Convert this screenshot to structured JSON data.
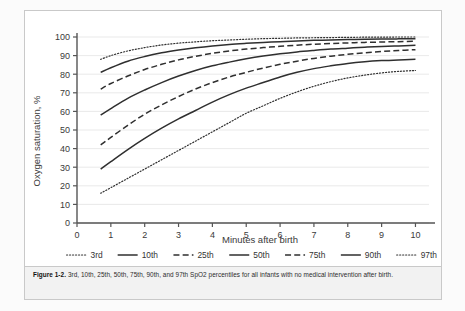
{
  "figure": {
    "caption_label": "Figure 1-2.",
    "caption_text": "3rd, 10th, 25th, 50th, 75th, 90th, and 97th SpO2 percentiles for all infants with no medical intervention after birth."
  },
  "chart_data": {
    "type": "line",
    "title": "",
    "xlabel": "Minutes after birth",
    "ylabel": "Oxygen saturation, %",
    "xlim": [
      0,
      10.4
    ],
    "ylim": [
      0,
      103
    ],
    "xticks": [
      "0",
      "1",
      "2",
      "3",
      "4",
      "5",
      "6",
      "7",
      "8",
      "9",
      "10"
    ],
    "yticks": [
      "0",
      "10",
      "20",
      "30",
      "40",
      "50",
      "60",
      "70",
      "80",
      "90",
      "100"
    ],
    "grid": true,
    "legend_position": "bottom",
    "x": [
      0.7,
      1,
      1.5,
      2,
      2.5,
      3,
      3.5,
      4,
      4.5,
      5,
      5.5,
      6,
      6.5,
      7,
      7.5,
      8,
      8.5,
      9,
      9.5,
      10
    ],
    "series": [
      {
        "name": "3rd",
        "style": "dotted",
        "values": [
          16,
          19,
          24,
          29,
          34,
          39,
          44,
          49,
          54,
          59,
          63,
          67,
          70.5,
          73.5,
          76,
          78,
          79.5,
          80.7,
          81.5,
          82
        ]
      },
      {
        "name": "10th",
        "style": "solid",
        "values": [
          29,
          33,
          39.5,
          45.5,
          51,
          56,
          60.5,
          65,
          69,
          72.5,
          75.5,
          78.5,
          81,
          83,
          84.5,
          85.8,
          86.7,
          87.3,
          87.7,
          88
        ]
      },
      {
        "name": "25th",
        "style": "dashed",
        "values": [
          42,
          46,
          52.5,
          58.5,
          63.5,
          68,
          72,
          75.5,
          78.5,
          81,
          83.3,
          85.3,
          87,
          88.5,
          89.7,
          90.7,
          91.5,
          92.2,
          92.7,
          93.2
        ]
      },
      {
        "name": "50th",
        "style": "solid",
        "values": [
          58,
          61.5,
          67,
          71.5,
          75.5,
          79,
          82,
          84.5,
          86.5,
          88.3,
          89.8,
          91,
          92,
          92.8,
          93.5,
          94,
          94.5,
          94.9,
          95.2,
          95.5
        ]
      },
      {
        "name": "75th",
        "style": "dashed",
        "values": [
          72,
          75,
          79,
          82.5,
          85.3,
          87.7,
          89.6,
          91.2,
          92.5,
          93.5,
          94.3,
          95,
          95.6,
          96.1,
          96.5,
          96.8,
          97.1,
          97.3,
          97.5,
          97.7
        ]
      },
      {
        "name": "90th",
        "style": "solid",
        "values": [
          81,
          83.5,
          87,
          89.5,
          91.5,
          93,
          94.2,
          95.2,
          96,
          96.6,
          97.1,
          97.5,
          97.9,
          98.2,
          98.4,
          98.6,
          98.8,
          98.9,
          99,
          99.1
        ]
      },
      {
        "name": "97th",
        "style": "dotted",
        "values": [
          88,
          90,
          92.5,
          94.3,
          95.7,
          96.7,
          97.4,
          98,
          98.4,
          98.8,
          99.1,
          99.3,
          99.5,
          99.6,
          99.7,
          99.8,
          99.9,
          99.9,
          100,
          100
        ]
      }
    ]
  }
}
